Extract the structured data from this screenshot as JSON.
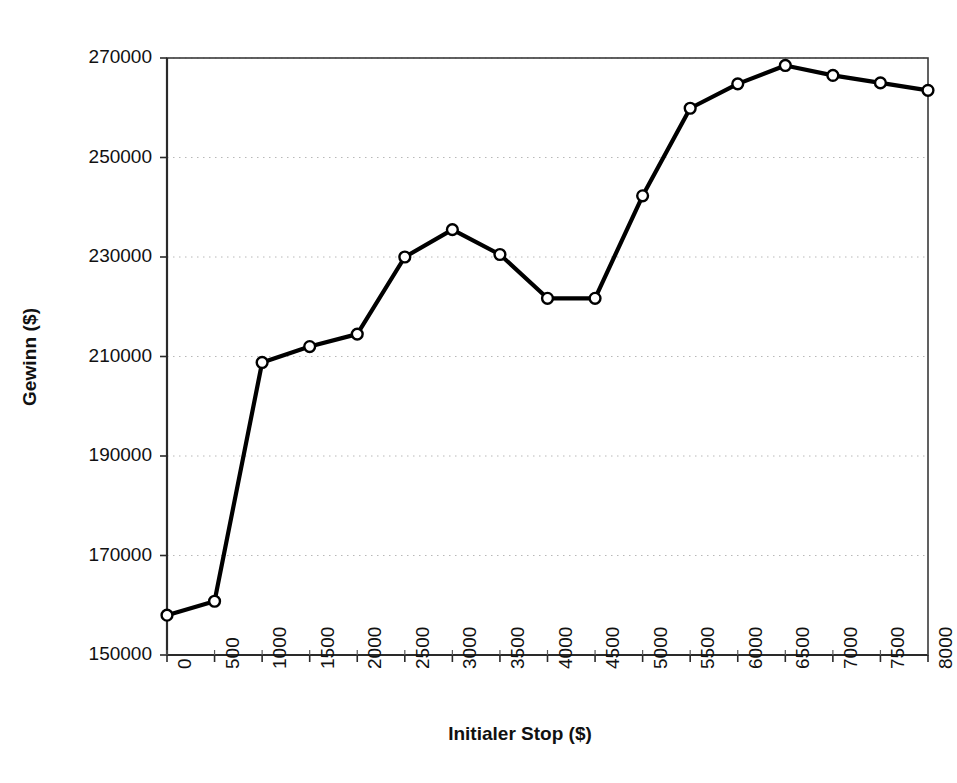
{
  "chart_data": {
    "type": "line",
    "title": "",
    "xlabel": "Initialer Stop ($)",
    "ylabel": "Gewinn ($)",
    "x": [
      0,
      500,
      1000,
      1500,
      2000,
      2500,
      3000,
      3500,
      4000,
      4500,
      5000,
      5500,
      6000,
      6500,
      7000,
      7500,
      8000
    ],
    "values": [
      158000,
      160800,
      208800,
      212000,
      214500,
      230000,
      235500,
      230500,
      221700,
      221700,
      242300,
      259900,
      264800,
      268500,
      266500,
      265000,
      263500
    ],
    "series": [
      {
        "name": "Gewinn",
        "values": [
          158000,
          160800,
          208800,
          212000,
          214500,
          230000,
          235500,
          230500,
          221700,
          221700,
          242300,
          259900,
          264800,
          268500,
          266500,
          265000,
          263500
        ]
      }
    ],
    "xlim": [
      0,
      8000
    ],
    "ylim": [
      150000,
      270000
    ],
    "x_ticks": [
      "0",
      "500",
      "1000",
      "1500",
      "2000",
      "2500",
      "3000",
      "3500",
      "4000",
      "4500",
      "5000",
      "5500",
      "6000",
      "6500",
      "7000",
      "7500",
      "8000"
    ],
    "y_ticks": [
      "150000",
      "170000",
      "190000",
      "210000",
      "230000",
      "250000",
      "270000"
    ],
    "y_tick_values": [
      150000,
      170000,
      190000,
      210000,
      230000,
      250000,
      270000
    ],
    "grid": "horizontal-dotted",
    "legend": "none",
    "marker": "open-circle",
    "line_color": "#000000",
    "marker_fill": "#ffffff",
    "grid_color": "#b8b8b8",
    "axis_color": "#3a3a3a",
    "plot_background": "#ffffff"
  }
}
